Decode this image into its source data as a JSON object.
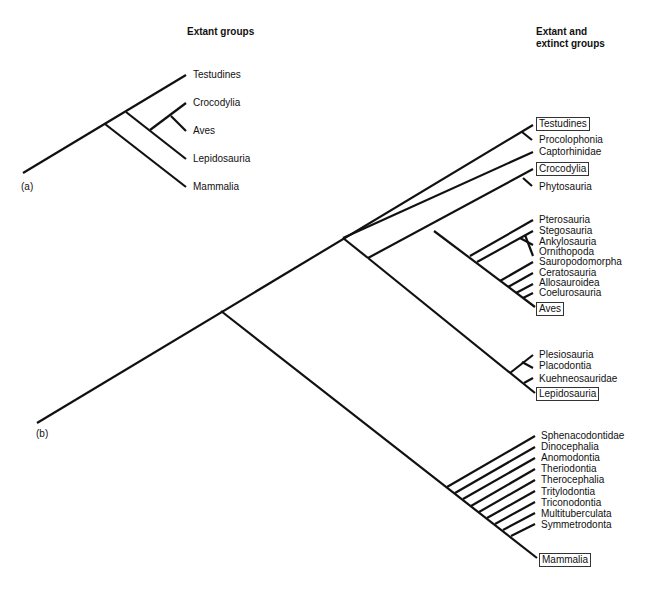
{
  "headers": {
    "a": "Extant groups",
    "b_line1": "Extant and",
    "b_line2": "extinct groups"
  },
  "panels": {
    "a": "(a)",
    "b": "(b)"
  },
  "tree_a": {
    "taxa": [
      "Testudines",
      "Crocodylia",
      "Aves",
      "Lepidosauria",
      "Mammalia"
    ]
  },
  "tree_b": {
    "taxa": [
      {
        "name": "Testudines",
        "extant": true
      },
      {
        "name": "Procolophonia",
        "extant": false
      },
      {
        "name": "Captorhinidae",
        "extant": false
      },
      {
        "name": "Crocodylia",
        "extant": true
      },
      {
        "name": "Phytosauria",
        "extant": false
      },
      {
        "name": "Pterosauria",
        "extant": false
      },
      {
        "name": "Stegosauria",
        "extant": false
      },
      {
        "name": "Ankylosauria",
        "extant": false
      },
      {
        "name": "Ornithopoda",
        "extant": false
      },
      {
        "name": "Sauropodomorpha",
        "extant": false
      },
      {
        "name": "Ceratosauria",
        "extant": false
      },
      {
        "name": "Allosauroidea",
        "extant": false
      },
      {
        "name": "Coelurosauria",
        "extant": false
      },
      {
        "name": "Aves",
        "extant": true
      },
      {
        "name": "Plesiosauria",
        "extant": false
      },
      {
        "name": "Placodontia",
        "extant": false
      },
      {
        "name": "Kuehneosauridae",
        "extant": false
      },
      {
        "name": "Lepidosauria",
        "extant": true
      },
      {
        "name": "Sphenacodontidae",
        "extant": false
      },
      {
        "name": "Dinocephalia",
        "extant": false
      },
      {
        "name": "Anomodontia",
        "extant": false
      },
      {
        "name": "Theriodontia",
        "extant": false
      },
      {
        "name": "Therocephalia",
        "extant": false
      },
      {
        "name": "Tritylodontia",
        "extant": false
      },
      {
        "name": "Triconodontia",
        "extant": false
      },
      {
        "name": "Multituberculata",
        "extant": false
      },
      {
        "name": "Symmetrodonta",
        "extant": false
      },
      {
        "name": "Mammalia",
        "extant": true
      }
    ]
  },
  "colors": {
    "line": "#111111",
    "background": "#ffffff"
  }
}
